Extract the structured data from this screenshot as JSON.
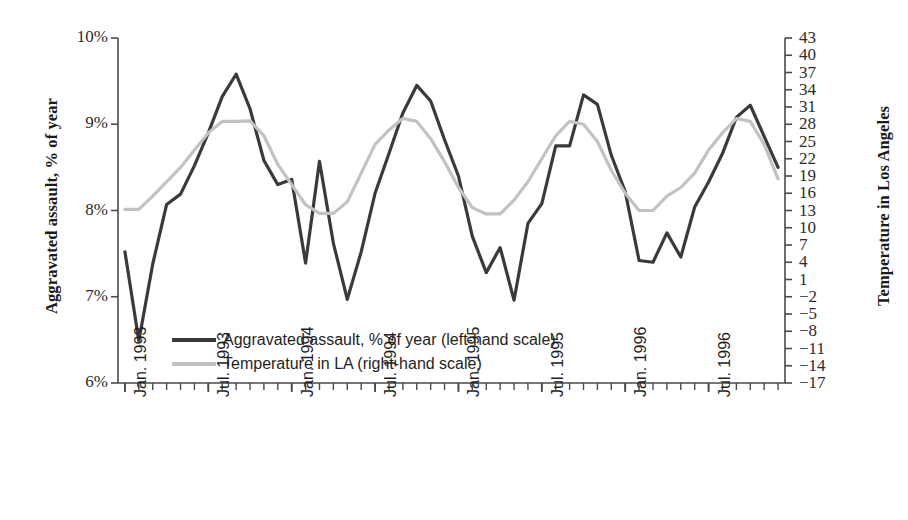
{
  "chart_data": {
    "type": "line",
    "title": "",
    "xlabel": "",
    "ylabel": "Aggravated assault, % of year",
    "ylabel_right": "Temperature in Los Angeles",
    "grid": false,
    "legend_position": "inside-bottom-left",
    "ylim": [
      6,
      10
    ],
    "ylim_right": [
      -17,
      43
    ],
    "ytick_labels": [
      "10%",
      "9%",
      "8%",
      "7%",
      "6%"
    ],
    "ytick_values": [
      10,
      9,
      8,
      7,
      6
    ],
    "ytick_right_labels": [
      "43",
      "40",
      "37",
      "34",
      "31",
      "28",
      "25",
      "22",
      "19",
      "16",
      "13",
      "10",
      "7",
      "4",
      "1",
      "−2",
      "−5",
      "−8",
      "−11",
      "−14",
      "−17"
    ],
    "ytick_right_values": [
      43,
      40,
      37,
      34,
      31,
      28,
      25,
      22,
      19,
      16,
      13,
      10,
      7,
      4,
      1,
      -2,
      -5,
      -8,
      -11,
      -14,
      -17
    ],
    "xtick_labels": [
      "Jan. 1993",
      "Jul. 1993",
      "Jan. 1994",
      "Jul. 1994",
      "Jan. 1995",
      "Jul. 1995",
      "Jan. 1996",
      "Jul. 1996"
    ],
    "xtick_index": [
      0,
      6,
      12,
      18,
      24,
      30,
      36,
      42
    ],
    "x_months": [
      "Jan. 1993",
      "Feb. 1993",
      "Mar. 1993",
      "Apr. 1993",
      "May 1993",
      "Jun. 1993",
      "Jul. 1993",
      "Aug. 1993",
      "Sep. 1993",
      "Oct. 1993",
      "Nov. 1993",
      "Dec. 1993",
      "Jan. 1994",
      "Feb. 1994",
      "Mar. 1994",
      "Apr. 1994",
      "May 1994",
      "Jun. 1994",
      "Jul. 1994",
      "Aug. 1994",
      "Sep. 1994",
      "Oct. 1994",
      "Nov. 1994",
      "Dec. 1994",
      "Jan. 1995",
      "Feb. 1995",
      "Mar. 1995",
      "Apr. 1995",
      "May 1995",
      "Jun. 1995",
      "Jul. 1995",
      "Aug. 1995",
      "Sep. 1995",
      "Oct. 1995",
      "Nov. 1995",
      "Dec. 1995",
      "Jan. 1996",
      "Feb. 1996",
      "Mar. 1996",
      "Apr. 1996",
      "May 1996",
      "Jun. 1996",
      "Jul. 1996",
      "Aug. 1996",
      "Sep. 1996",
      "Oct. 1996",
      "Nov. 1996",
      "Dec. 1996"
    ],
    "series": [
      {
        "name": "Aggravated assault, % of year (left-hand scale)",
        "axis": "left",
        "color": "#3a3a3a",
        "width": 3.2,
        "values": [
          7.52,
          6.49,
          7.38,
          8.07,
          8.19,
          8.52,
          8.9,
          9.32,
          9.58,
          9.18,
          8.58,
          8.3,
          8.36,
          7.39,
          8.57,
          7.62,
          6.97,
          7.52,
          8.2,
          8.66,
          9.13,
          9.45,
          9.27,
          8.82,
          8.4,
          7.7,
          7.28,
          7.57,
          6.96,
          7.85,
          8.08,
          8.75,
          8.75,
          9.34,
          9.23,
          8.64,
          8.22,
          7.42,
          7.4,
          7.74,
          7.46,
          8.04,
          8.33,
          8.66,
          9.08,
          9.22,
          8.86,
          8.5
        ]
      },
      {
        "name": "Temperature in LA (right-hand scale)",
        "axis": "right",
        "color": "#c2c2c2",
        "width": 3.2,
        "values": [
          13.2,
          13.2,
          15.5,
          18.0,
          20.5,
          23.5,
          26.5,
          28.5,
          28.5,
          28.6,
          26.0,
          21.0,
          17.5,
          14.0,
          12.5,
          12.5,
          14.5,
          19.5,
          24.5,
          27.0,
          29.0,
          28.5,
          25.5,
          21.5,
          17.0,
          13.5,
          12.4,
          12.4,
          14.8,
          18.0,
          22.0,
          26.0,
          28.5,
          28.0,
          25.0,
          20.0,
          16.0,
          13.0,
          13.0,
          15.5,
          17.0,
          19.5,
          23.5,
          26.5,
          29.0,
          28.5,
          24.5,
          18.5
        ]
      }
    ]
  },
  "legend": {
    "entries": [
      {
        "label": "Aggravated assault, % of year (left-hand scale)",
        "style": "dark"
      },
      {
        "label": "Temperature in LA (right-hand scale)",
        "style": "light"
      }
    ]
  },
  "colors": {
    "series_dark": "#3a3a3a",
    "series_light": "#c2c2c2",
    "axis": "#4a4a4a",
    "text": "#1f1f1f",
    "background": "#ffffff"
  }
}
